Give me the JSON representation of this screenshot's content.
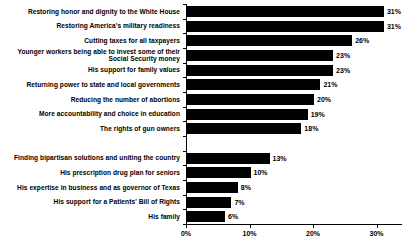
{
  "chart_data": {
    "type": "bar",
    "orientation": "horizontal",
    "title": "",
    "xlabel": "",
    "ylabel": "",
    "xlim": [
      0,
      34
    ],
    "xticks": [
      "0%",
      "10%",
      "20%",
      "30%"
    ],
    "xtick_values": [
      0,
      10,
      20,
      30
    ],
    "grid": false,
    "legend": false,
    "bar_color": "#000000",
    "value_suffix": "%",
    "categories": [
      "Restoring honor and dignity to the White House",
      "Restoring America's military readiness",
      "Cutting taxes for all taxpayers",
      "Younger workers being able to invest some of their\nSocial Security money",
      "His support for family values",
      "Returning power to state and local governments",
      "Reducing the number of abortions",
      "More accountability and choice in education",
      "The rights of gun owners",
      "",
      "Finding bipartisan solutions and uniting the country",
      "His prescription drug plan for seniors",
      "His expertise in business and as governor of Texas",
      "His support for a Patients' Bill of Rights",
      "His family"
    ],
    "values": [
      31,
      31,
      26,
      23,
      23,
      21,
      20,
      19,
      18,
      null,
      13,
      10,
      8,
      7,
      6
    ],
    "value_labels": [
      "31%",
      "31%",
      "26%",
      "23%",
      "23%",
      "21%",
      "20%",
      "19%",
      "18%",
      "",
      "13%",
      "10%",
      "8%",
      "7%",
      "6%"
    ]
  }
}
